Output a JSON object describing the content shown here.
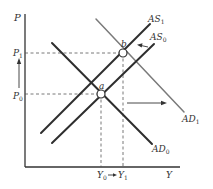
{
  "diagram": {
    "colors": {
      "axis": "#333333",
      "dark_line": "#2e2e2e",
      "light_line": "#7a7a7a",
      "dashed": "#555555",
      "point_fill": "#ffffff"
    },
    "axes": {
      "y_label": "P",
      "x_label": "Y"
    },
    "price_levels": {
      "p1": {
        "base": "P",
        "sub": "1"
      },
      "p0": {
        "base": "P",
        "sub": "0"
      }
    },
    "output_levels": {
      "y0": {
        "base": "Y",
        "sub": "0"
      },
      "y1": {
        "base": "Y",
        "sub": "1"
      }
    },
    "curves": {
      "as1": {
        "base": "AS",
        "sub": "1"
      },
      "as0": {
        "base": "AS",
        "sub": "0"
      },
      "ad1": {
        "base": "AD",
        "sub": "1"
      },
      "ad0": {
        "base": "AD",
        "sub": "0"
      }
    },
    "points": {
      "a": "a",
      "b": "b"
    }
  }
}
